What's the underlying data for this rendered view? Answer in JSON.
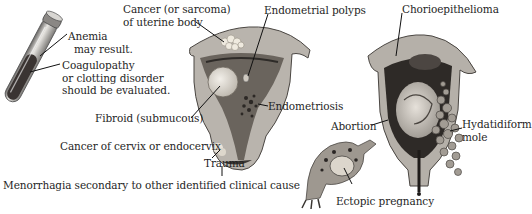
{
  "labels": {
    "anemia": [
      "Anemia",
      "may result."
    ],
    "coagulopathy": [
      "Coagulopathy",
      "or clotting disorder",
      "should be evaluated."
    ],
    "cancer_uterine": [
      "Cancer (or sarcoma)",
      "of uterine body"
    ],
    "endometrial_polyps": "Endometrial polyps",
    "fibroid": "Fibroid (submucous)",
    "endometriosis": "Endometriosis",
    "cancer_cervix": "Cancer of cervix or endocervix",
    "trauma": "Trauma",
    "chorioepithelioma": "Chorioepithelioma",
    "abortion": "Abortion",
    "hydatidiform": [
      "Hydatidiform",
      "mole"
    ],
    "ectopic": "Ectopic pregnancy",
    "caption": "Menorrhagia secondary to other identified clinical cause"
  },
  "figures": [
    {
      "name": "blood-test-tube"
    },
    {
      "name": "uterus-pathologies"
    },
    {
      "name": "pregnant-uterus"
    },
    {
      "name": "ectopic-tube"
    },
    {
      "name": "hydatidiform-mole-cluster"
    }
  ],
  "colors": {
    "tissue": "#b9b4ad",
    "tissue_dark": "#5e5a55",
    "cavity": "#3b3733",
    "fibroid": "#e4dfd6",
    "line": "#1a1a1a"
  }
}
